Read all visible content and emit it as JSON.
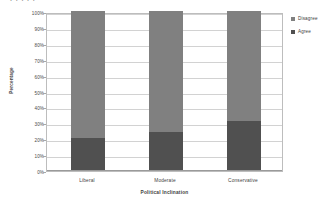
{
  "top_cut_text": "l l  l  l  l",
  "chart_data": {
    "type": "bar",
    "subtype": "stacked-percent",
    "title": "",
    "xlabel": "Political Inclination",
    "ylabel": "Percentage",
    "categories": [
      "Liberal",
      "Moderate",
      "Conservative"
    ],
    "series": [
      {
        "name": "Agree",
        "values": [
          20,
          24,
          31
        ],
        "color": "#505050"
      },
      {
        "name": "Disagree",
        "values": [
          80,
          76,
          69
        ],
        "color": "#808080"
      }
    ],
    "stack_order_bottom_to_top": [
      "Agree",
      "Disagree"
    ],
    "ylim": [
      0,
      100
    ],
    "ytick_values": [
      0,
      10,
      20,
      30,
      40,
      50,
      60,
      70,
      80,
      90,
      100
    ],
    "ytick_labels": [
      "0%",
      "10%",
      "20%",
      "30%",
      "40%",
      "50%",
      "60%",
      "70%",
      "80%",
      "90%",
      "100%"
    ],
    "grid": true,
    "grid_axis": "y",
    "legend_position": "right",
    "legend_entries": [
      {
        "label": "Disagree",
        "color": "#808080"
      },
      {
        "label": "Agree",
        "color": "#505050"
      }
    ],
    "plot_background": "#ffffff",
    "border_color": "#bdbdbd",
    "gridline_color": "#d2d2d2"
  }
}
